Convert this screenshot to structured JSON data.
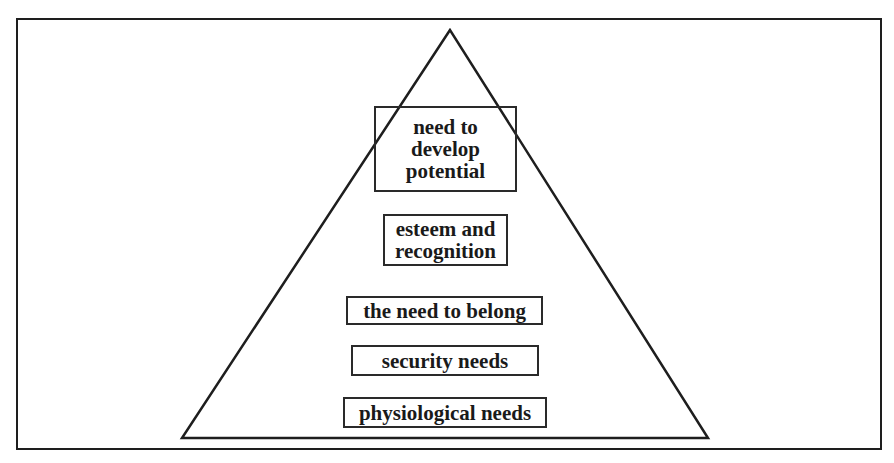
{
  "diagram": {
    "type": "pyramid",
    "title": "",
    "levels": [
      {
        "rank": 5,
        "label": "need to\ndevelop\npotential"
      },
      {
        "rank": 4,
        "label": "esteem and\nrecognition"
      },
      {
        "rank": 3,
        "label": "the need to belong"
      },
      {
        "rank": 2,
        "label": "security needs"
      },
      {
        "rank": 1,
        "label": "physiological needs"
      }
    ],
    "colors": {
      "line": "#1e1e1e",
      "background": "#ffffff",
      "text": "#1a1a1a"
    }
  }
}
